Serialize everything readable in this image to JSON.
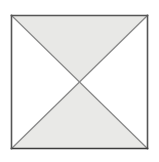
{
  "figure": {
    "description": "A square outline on a white background with its two diagonals drawn from corner to corner, dividing it into four triangles. The top and bottom triangles are shaded light gray; the left and right triangles are white.",
    "canvas": {
      "width": 159,
      "height": 162,
      "background_color": "#ffffff"
    },
    "square": {
      "name": "square",
      "left": 11.5,
      "top": 15.5,
      "right": 147.5,
      "bottom": 148.5,
      "width": 136,
      "height": 133,
      "stroke_color": "#555555",
      "stroke_color_bottom": "#3b3b3b",
      "stroke_width": 1.6,
      "fill_color": "#ffffff"
    },
    "center_point": {
      "name": "diagonal-intersection",
      "x": 79.5,
      "y": 82.0
    },
    "diagonals": [
      {
        "name": "diagonal-top-left-to-bottom-right",
        "x1": 11.5,
        "y1": 15.5,
        "x2": 147.5,
        "y2": 148.5,
        "stroke_color": "#8a8a8a",
        "stroke_width": 1.3
      },
      {
        "name": "diagonal-top-right-to-bottom-left",
        "x1": 147.5,
        "y1": 15.5,
        "x2": 11.5,
        "y2": 148.5,
        "stroke_color": "#8a8a8a",
        "stroke_width": 1.3
      }
    ],
    "triangles": [
      {
        "name": "triangle-top",
        "position": "top",
        "fill_color": "#e8e8e6",
        "points": "11.5,15.5 147.5,15.5 79.5,82.0"
      },
      {
        "name": "triangle-right",
        "position": "right",
        "fill_color": "#ffffff",
        "points": "147.5,15.5 147.5,148.5 79.5,82.0"
      },
      {
        "name": "triangle-bottom",
        "position": "bottom",
        "fill_color": "#e9e9e7",
        "points": "147.5,148.5 11.5,148.5 79.5,82.0"
      },
      {
        "name": "triangle-left",
        "position": "left",
        "fill_color": "#ffffff",
        "points": "11.5,148.5 11.5,15.5 79.5,82.0"
      }
    ]
  }
}
